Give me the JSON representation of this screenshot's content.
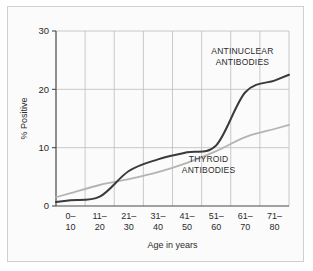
{
  "chart_data": {
    "type": "line",
    "title": "",
    "xlabel": "Age in years",
    "ylabel": "% Positive",
    "categories": [
      "0–10",
      "11–20",
      "21–30",
      "31–40",
      "41–50",
      "51–60",
      "61–70",
      "71–80"
    ],
    "category_lines": [
      [
        "0–",
        "10"
      ],
      [
        "11–",
        "20"
      ],
      [
        "21–",
        "30"
      ],
      [
        "31–",
        "40"
      ],
      [
        "41–",
        "50"
      ],
      [
        "51–",
        "60"
      ],
      [
        "61–",
        "70"
      ],
      [
        "71–",
        "80"
      ]
    ],
    "ylim": [
      0,
      30
    ],
    "yticks": [
      0,
      10,
      20,
      30
    ],
    "ytick_labels": [
      "0",
      "10",
      "20",
      "30"
    ],
    "grid": "both",
    "legend_position": "inline-annotations",
    "series": [
      {
        "name": "ANTINUCLEAR ANTIBODIES",
        "label_lines": [
          "ANTINUCLEAR",
          "ANTIBODIES"
        ],
        "color": "#3a3a3a",
        "width": 2.0,
        "values": [
          1.0,
          1.6,
          6.0,
          8.0,
          9.2,
          10.4,
          19.5,
          21.5
        ]
      },
      {
        "name": "THYROID ANTIBODIES",
        "label_lines": [
          "THYROID",
          "ANTIBODIES"
        ],
        "color": "#b4b4b4",
        "width": 1.8,
        "values": [
          2.2,
          3.6,
          4.6,
          5.8,
          7.4,
          9.4,
          11.8,
          13.2
        ]
      }
    ],
    "annotations": [
      {
        "text_lines": [
          "ANTINUCLEAR",
          "ANTIBODIES"
        ],
        "x_frac": 0.8,
        "y_value": 26.0
      },
      {
        "text_lines": [
          "THYROID",
          "ANTIBODIES"
        ],
        "x_frac": 0.655,
        "y_value": 7.6
      }
    ]
  },
  "colors": {
    "axis": "#4a4a4a",
    "grid": "#bdbdbd",
    "background": "#fbfbfb",
    "border": "#cfcfcf",
    "text": "#2b2b2b",
    "series_dark": "#3a3a3a",
    "series_light": "#b4b4b4"
  }
}
